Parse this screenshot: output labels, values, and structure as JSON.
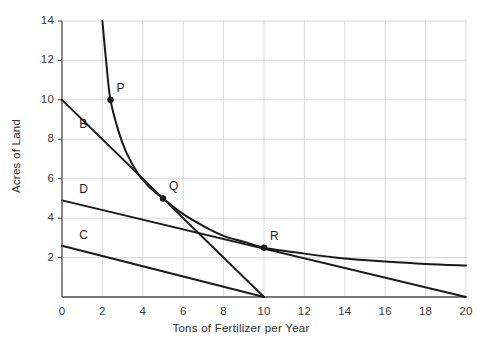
{
  "chart_data": {
    "type": "line",
    "title": "",
    "xlabel": "Tons of Fertilizer per Year",
    "ylabel": "Acres of Land",
    "xlim": [
      0,
      20
    ],
    "ylim": [
      0,
      14
    ],
    "xticks": [
      0,
      2,
      4,
      6,
      8,
      10,
      12,
      14,
      16,
      18,
      20
    ],
    "yticks": [
      2,
      4,
      6,
      8,
      10,
      12,
      14
    ],
    "grid": true,
    "legend": "none",
    "series": [
      {
        "name": "isoquant-curve",
        "kind": "curve",
        "points": [
          [
            2.0,
            14.0
          ],
          [
            2.2,
            11.8
          ],
          [
            2.4,
            10.0
          ],
          [
            2.8,
            8.4
          ],
          [
            3.2,
            7.3
          ],
          [
            3.8,
            6.2
          ],
          [
            4.4,
            5.5
          ],
          [
            5.0,
            5.0
          ],
          [
            6.0,
            4.2
          ],
          [
            7.0,
            3.6
          ],
          [
            8.0,
            3.1
          ],
          [
            9.0,
            2.8
          ],
          [
            10.0,
            2.5
          ],
          [
            12.0,
            2.2
          ],
          [
            14.0,
            1.95
          ],
          [
            16.0,
            1.8
          ],
          [
            18.0,
            1.68
          ],
          [
            20.0,
            1.6
          ]
        ]
      },
      {
        "name": "line-B",
        "kind": "line",
        "points": [
          [
            0,
            10.0
          ],
          [
            10.0,
            0
          ]
        ]
      },
      {
        "name": "line-D",
        "kind": "line",
        "points": [
          [
            0,
            4.9
          ],
          [
            20.0,
            0
          ]
        ]
      },
      {
        "name": "line-C",
        "kind": "line",
        "points": [
          [
            0,
            2.6
          ],
          [
            10.0,
            0
          ]
        ]
      }
    ],
    "annotations": [
      {
        "label": "P",
        "x": 2.4,
        "y": 10.0,
        "marker": true
      },
      {
        "label": "Q",
        "x": 5.0,
        "y": 5.0,
        "marker": true
      },
      {
        "label": "R",
        "x": 10.0,
        "y": 2.5,
        "marker": true
      },
      {
        "label": "B",
        "x": 0.75,
        "y": 8.7,
        "marker": false
      },
      {
        "label": "D",
        "x": 0.75,
        "y": 5.45,
        "marker": false
      },
      {
        "label": "C",
        "x": 0.75,
        "y": 3.1,
        "marker": false
      }
    ],
    "colors": {
      "line": "#1a1a1a",
      "grid": "#cfcfcf",
      "axis": "#4a4a4a",
      "text": "#2e2e2e",
      "background": "#ffffff"
    }
  },
  "ticks": {
    "x": [
      "0",
      "2",
      "4",
      "6",
      "8",
      "10",
      "12",
      "14",
      "16",
      "18",
      "20"
    ],
    "y": [
      "2",
      "4",
      "6",
      "8",
      "10",
      "12",
      "14"
    ]
  },
  "axis_titles": {
    "x": "Tons of Fertilizer per Year",
    "y": "Acres of Land"
  },
  "labels": {
    "P": "P",
    "Q": "Q",
    "R": "R",
    "B": "B",
    "C": "C",
    "D": "D"
  }
}
